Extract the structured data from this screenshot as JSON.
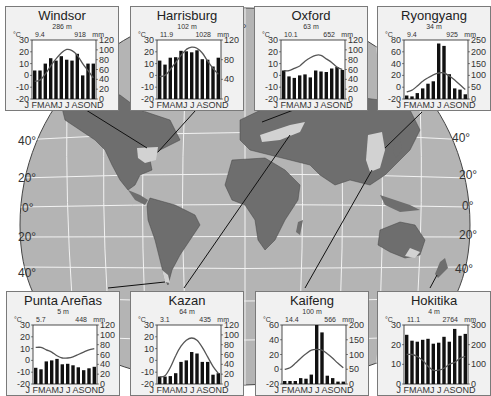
{
  "figure": {
    "latitude_labels_left": [
      "40°",
      "20°",
      "0°",
      "20°",
      "40°"
    ],
    "latitude_labels_right": [
      "40°",
      "20°",
      "0°",
      "20°",
      "40°"
    ],
    "top_label": "0°",
    "colors": {
      "ocean": "#b4b4b4",
      "land": "#6e6e6e",
      "highlight_land": "#d2d2d2",
      "grid": "#f0f0f0",
      "card_bg": "#f1f1f1",
      "bar": "#111111",
      "temp_line": "#555555"
    }
  },
  "chart_data": [
    {
      "type": "bar+line",
      "title": "Windsor",
      "elevation": "286 m",
      "mean_temp_label": "9.4",
      "annual_precip_label": "918",
      "temp_unit": "°C",
      "precip_unit": "mm",
      "x": [
        "J",
        "F",
        "M",
        "A",
        "M",
        "J",
        "J",
        "A",
        "S",
        "O",
        "N",
        "D"
      ],
      "xlabel": "J FMAMJ J ASOND",
      "temp_axis": {
        "ticks": [
          30,
          20,
          10,
          0,
          -10,
          -20
        ],
        "ylim": [
          -20,
          30
        ]
      },
      "precip_axis": {
        "ticks": [
          120,
          100,
          80,
          60,
          40,
          20,
          0
        ],
        "ylim": [
          0,
          120
        ]
      },
      "precipitation_mm": [
        58,
        58,
        72,
        83,
        78,
        87,
        80,
        78,
        92,
        48,
        72,
        72
      ],
      "temperature_c": [
        -5,
        -4,
        1,
        8,
        14,
        19,
        22,
        21,
        17,
        10,
        4,
        -2
      ]
    },
    {
      "type": "bar+line",
      "title": "Harrisburg",
      "elevation": "102 m",
      "mean_temp_label": "11.9",
      "annual_precip_label": "1028",
      "temp_unit": "°C",
      "precip_unit": "mm",
      "x": [
        "J",
        "F",
        "M",
        "A",
        "M",
        "J",
        "J",
        "A",
        "S",
        "O",
        "N",
        "D"
      ],
      "xlabel": "J FMAMJ J ASOND",
      "temp_axis": {
        "ticks": [
          30,
          20,
          10,
          0,
          -10,
          -20
        ],
        "ylim": [
          -20,
          30
        ]
      },
      "precip_axis": {
        "ticks": [
          120,
          80,
          40,
          0
        ],
        "ylim": [
          0,
          120
        ]
      },
      "precipitation_mm": [
        78,
        70,
        84,
        85,
        98,
        97,
        95,
        99,
        81,
        80,
        66,
        84
      ],
      "temperature_c": [
        -1,
        0,
        5,
        11,
        17,
        22,
        24,
        23,
        19,
        12,
        6,
        1
      ]
    },
    {
      "type": "bar+line",
      "title": "Oxford",
      "elevation": "63 m",
      "mean_temp_label": "10.1",
      "annual_precip_label": "652",
      "temp_unit": "°C",
      "precip_unit": "mm",
      "x": [
        "J",
        "F",
        "M",
        "A",
        "M",
        "J",
        "J",
        "A",
        "S",
        "O",
        "N",
        "D"
      ],
      "xlabel": "J FMAMJ J ASOND",
      "temp_axis": {
        "ticks": [
          30,
          20,
          10,
          0,
          -10,
          -20
        ],
        "ylim": [
          -20,
          30
        ]
      },
      "precip_axis": {
        "ticks": [
          120,
          100,
          80,
          60,
          40,
          20,
          0
        ],
        "ylim": [
          0,
          120
        ]
      },
      "precipitation_mm": [
        58,
        46,
        43,
        48,
        50,
        44,
        58,
        56,
        55,
        62,
        65,
        59
      ],
      "temperature_c": [
        4,
        4,
        6,
        8,
        12,
        15,
        17,
        17,
        14,
        11,
        7,
        5
      ]
    },
    {
      "type": "bar+line",
      "title": "Ryongyang",
      "elevation": "34 m",
      "mean_temp_label": "9.4",
      "annual_precip_label": "925",
      "temp_unit": "°C",
      "precip_unit": "mm",
      "x": [
        "J",
        "F",
        "M",
        "A",
        "M",
        "J",
        "J",
        "A",
        "S",
        "O",
        "N",
        "D"
      ],
      "xlabel": "J FMAMJ J ASOND",
      "temp_axis": {
        "ticks": [
          80,
          60,
          40,
          20,
          0,
          -20
        ],
        "ylim": [
          -20,
          80
        ]
      },
      "precip_axis": {
        "ticks": [
          250,
          200,
          150,
          100,
          50,
          0
        ],
        "ylim": [
          0,
          250
        ]
      },
      "precipitation_mm": [
        15,
        11,
        25,
        45,
        65,
        75,
        235,
        225,
        105,
        45,
        40,
        20
      ],
      "temperature_c": [
        -8,
        -5,
        2,
        10,
        16,
        21,
        24,
        24,
        19,
        12,
        4,
        -4
      ]
    },
    {
      "type": "bar+line",
      "title": "Punta Areñas",
      "elevation": "5 m",
      "mean_temp_label": "5.7",
      "annual_precip_label": "448",
      "temp_unit": "°C",
      "precip_unit": "mm",
      "x": [
        "J",
        "F",
        "M",
        "A",
        "M",
        "J",
        "J",
        "A",
        "S",
        "O",
        "N",
        "D"
      ],
      "xlabel": "J FMAMJ J ASOND",
      "temp_axis": {
        "ticks": [
          30,
          20,
          10,
          0,
          -10,
          -20
        ],
        "ylim": [
          -20,
          30
        ]
      },
      "precip_axis": {
        "ticks": [
          120,
          100,
          80,
          60,
          40,
          20,
          0
        ],
        "ylim": [
          0,
          120
        ]
      },
      "precipitation_mm": [
        33,
        30,
        46,
        48,
        51,
        40,
        41,
        38,
        34,
        28,
        32,
        35
      ],
      "temperature_c": [
        11,
        11,
        9,
        7,
        4,
        2,
        2,
        3,
        5,
        7,
        9,
        10
      ]
    },
    {
      "type": "bar+line",
      "title": "Kazan",
      "elevation": "64 m",
      "mean_temp_label": "3.1",
      "annual_precip_label": "435",
      "temp_unit": "°C",
      "precip_unit": "mm",
      "x": [
        "J",
        "F",
        "M",
        "A",
        "M",
        "J",
        "J",
        "A",
        "S",
        "O",
        "N",
        "D"
      ],
      "xlabel": "J FMAMJ J ASOND",
      "temp_axis": {
        "ticks": [
          30,
          20,
          10,
          0,
          -10,
          -20
        ],
        "ylim": [
          -20,
          30
        ]
      },
      "precip_axis": {
        "ticks": [
          120,
          100,
          80,
          60,
          40,
          20,
          0
        ],
        "ylim": [
          0,
          120
        ]
      },
      "precipitation_mm": [
        15,
        15,
        16,
        22,
        45,
        48,
        65,
        62,
        45,
        45,
        19,
        22
      ],
      "temperature_c": [
        -14,
        -13,
        -6,
        4,
        12,
        17,
        19,
        17,
        11,
        3,
        -5,
        -11
      ]
    },
    {
      "type": "bar+line",
      "title": "Kaifeng",
      "elevation": "100 m",
      "mean_temp_label": "14.4",
      "annual_precip_label": "566",
      "temp_unit": "°C",
      "precip_unit": "mm",
      "x": [
        "J",
        "F",
        "M",
        "A",
        "M",
        "J",
        "J",
        "A",
        "S",
        "O",
        "N",
        "D"
      ],
      "xlabel": "J FMAMJ J ASOND",
      "temp_axis": {
        "ticks": [
          60,
          40,
          20,
          0,
          -20
        ],
        "ylim": [
          -20,
          60
        ]
      },
      "precip_axis": {
        "ticks": [
          200,
          150,
          100,
          50,
          0
        ],
        "ylim": [
          0,
          200
        ]
      },
      "precipitation_mm": [
        10,
        10,
        10,
        20,
        18,
        32,
        200,
        175,
        28,
        20,
        8,
        8
      ],
      "temperature_c": [
        0,
        2,
        8,
        15,
        21,
        26,
        27,
        26,
        21,
        15,
        8,
        2
      ]
    },
    {
      "type": "bar+line",
      "title": "Hokitika",
      "elevation": "4 m",
      "mean_temp_label": "11.1",
      "annual_precip_label": "2764",
      "temp_unit": "°C",
      "precip_unit": "mm",
      "x": [
        "J",
        "F",
        "M",
        "A",
        "M",
        "J",
        "J",
        "A",
        "S",
        "O",
        "N",
        "D"
      ],
      "xlabel": "J FMAMJ J ASOND",
      "temp_axis": {
        "ticks": [
          30,
          20,
          10,
          0
        ],
        "ylim": [
          0,
          30
        ]
      },
      "precip_axis": {
        "ticks": [
          300,
          200,
          100,
          0
        ],
        "ylim": [
          0,
          300
        ]
      },
      "precipitation_mm": [
        250,
        220,
        215,
        225,
        230,
        205,
        210,
        240,
        215,
        280,
        245,
        255
      ],
      "temperature_c": [
        15,
        15,
        14,
        12,
        9,
        7,
        7,
        8,
        10,
        11,
        13,
        14
      ]
    }
  ]
}
